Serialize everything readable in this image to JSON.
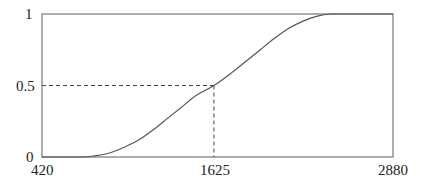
{
  "chart_data": {
    "type": "line",
    "title": "",
    "xlabel": "",
    "ylabel": "",
    "xlim": [
      420,
      2880
    ],
    "ylim": [
      0,
      1
    ],
    "grid": false,
    "legend": null,
    "x_ticks": [
      "420",
      "1625",
      "2880"
    ],
    "y_ticks": [
      "0",
      "0.5",
      "1"
    ],
    "series": [
      {
        "name": "curve",
        "x": [
          420,
          700,
          800,
          900,
          1000,
          1100,
          1200,
          1300,
          1400,
          1500,
          1625,
          1750,
          1850,
          1950,
          2050,
          2150,
          2250,
          2350,
          2450,
          2550,
          2880
        ],
        "y": [
          0,
          0,
          0.01,
          0.03,
          0.07,
          0.12,
          0.19,
          0.27,
          0.35,
          0.43,
          0.5,
          0.59,
          0.67,
          0.75,
          0.83,
          0.9,
          0.95,
          0.985,
          1,
          1,
          1
        ]
      }
    ],
    "annotations": [
      {
        "type": "dashed-guide",
        "from": [
          420,
          0.5
        ],
        "to": [
          1625,
          0.5
        ]
      },
      {
        "type": "dashed-guide",
        "from": [
          1625,
          0.5
        ],
        "to": [
          1625,
          0
        ]
      }
    ]
  },
  "colors": {
    "axis": "#777777",
    "curve": "#555555",
    "guide": "#444444",
    "text": "#222222"
  }
}
